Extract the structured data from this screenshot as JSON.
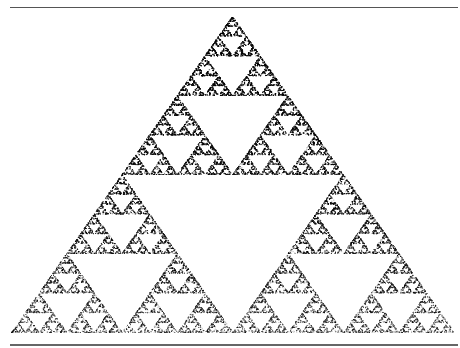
{
  "figure": {
    "vertices": [
      [
        232,
        16
      ],
      [
        11,
        332
      ],
      [
        454,
        332
      ]
    ],
    "points": 60000,
    "dot_color": "#000000",
    "background": "#ffffff",
    "rule_color": "#555555"
  }
}
